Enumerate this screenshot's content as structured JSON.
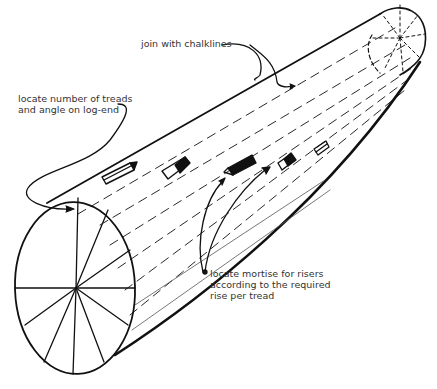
{
  "diagram": {
    "colors": {
      "ink": "#111111",
      "text": "#333333",
      "background": "#ffffff"
    }
  },
  "labels": {
    "chalklines": "join with chalklines",
    "treads_line1": "locate number of treads",
    "treads_line2": "and angle on log-end",
    "mortise_line1": "locate mortise for risers",
    "mortise_line2": "according to the required",
    "mortise_line3": "rise per tread"
  },
  "icons": {
    "log": "log-cylinder-icon",
    "log_end_near": "log-end-divided-circle",
    "log_end_far": "log-end-dashed-circle",
    "mortises": [
      "mortise-1",
      "mortise-2",
      "mortise-3",
      "mortise-4",
      "mortise-5"
    ]
  }
}
